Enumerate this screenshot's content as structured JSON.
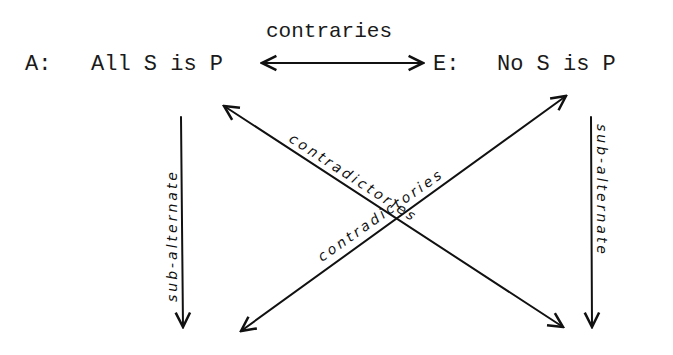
{
  "diagram": {
    "corners": {
      "A": {
        "label": "A:",
        "proposition": "All S is P"
      },
      "E": {
        "label": "E:",
        "proposition": "No S is P"
      }
    },
    "relations": {
      "contraries": "contraries",
      "contradictories_1": "contradictories",
      "contradictories_2": "contradictories",
      "subalternate_left": "sub-alternate",
      "subalternate_right": "sub-alternate"
    }
  }
}
